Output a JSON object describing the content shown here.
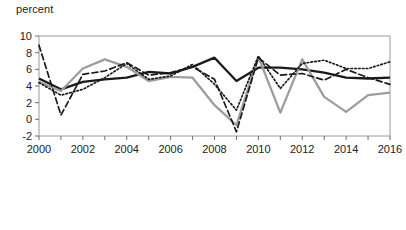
{
  "chart_data": {
    "type": "line",
    "title": "",
    "subtitle": "",
    "xlabel": "",
    "ylabel": "percent",
    "ylabel_position": "top-left",
    "x": [
      2000,
      2001,
      2002,
      2003,
      2004,
      2005,
      2006,
      2007,
      2008,
      2009,
      2010,
      2011,
      2012,
      2013,
      2014,
      2015,
      2016
    ],
    "xlim": [
      2000,
      2016
    ],
    "ylim": [
      -2,
      10
    ],
    "xticks": [
      2000,
      2001,
      2002,
      2003,
      2004,
      2005,
      2006,
      2007,
      2008,
      2009,
      2010,
      2011,
      2012,
      2013,
      2014,
      2015,
      2016
    ],
    "xtick_labels": [
      "2000",
      "",
      "2002",
      "",
      "2004",
      "",
      "2006",
      "",
      "2008",
      "",
      "2010",
      "",
      "2012",
      "",
      "2014",
      "",
      "2016"
    ],
    "yticks": [
      -2,
      0,
      2,
      4,
      6,
      8,
      10
    ],
    "ytick_labels": [
      "-2",
      "0",
      "2",
      "4",
      "6",
      "8",
      "10"
    ],
    "grid": false,
    "legend_position": "bottom-left",
    "series": [
      {
        "name": "Indonesia",
        "style": "solid",
        "color": "#1a1a1a",
        "width": 2.3,
        "values": [
          4.9,
          3.6,
          4.5,
          4.8,
          5.0,
          5.7,
          5.5,
          6.3,
          7.4,
          4.6,
          6.2,
          6.2,
          6.0,
          5.6,
          5.0,
          4.9,
          5.0
        ]
      },
      {
        "name": "Thailand",
        "style": "solid",
        "color": "#9d9d9d",
        "width": 2.3,
        "values": [
          4.5,
          3.4,
          6.1,
          7.2,
          6.3,
          4.6,
          5.1,
          5.0,
          1.7,
          -0.7,
          7.5,
          0.8,
          7.2,
          2.7,
          0.9,
          2.9,
          3.2
        ]
      },
      {
        "name": "Malaysia",
        "style": "dashed",
        "color": "#1a1a1a",
        "width": 1.7,
        "values": [
          8.9,
          0.5,
          5.4,
          5.8,
          6.8,
          5.3,
          5.6,
          6.3,
          4.8,
          -1.5,
          7.4,
          5.3,
          5.5,
          4.7,
          6.0,
          5.0,
          4.2
        ]
      },
      {
        "name": "Philippines",
        "style": "dotted",
        "color": "#1a1a1a",
        "width": 1.7,
        "values": [
          4.4,
          2.9,
          3.6,
          5.0,
          6.7,
          4.8,
          5.2,
          6.6,
          4.2,
          1.1,
          7.6,
          3.7,
          6.7,
          7.1,
          6.1,
          6.1,
          6.9
        ]
      }
    ]
  },
  "legend": {
    "entries": [
      {
        "label": "Indonesia",
        "swatch": "solid-black-line"
      },
      {
        "label": "Thailand",
        "swatch": "solid-gray-line"
      },
      {
        "label": "Malaysia",
        "swatch": "dashed-black-line"
      },
      {
        "label": "Philippines",
        "swatch": "dotted-black-line"
      }
    ]
  }
}
